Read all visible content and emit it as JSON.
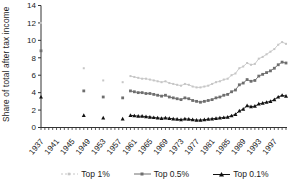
{
  "chart_data": {
    "type": "line",
    "title": "",
    "xlabel": "",
    "ylabel": "Share of total after tax income",
    "ylim": [
      0,
      14
    ],
    "yticks": [
      0,
      2,
      4,
      6,
      8,
      10,
      12,
      14
    ],
    "xlim": [
      1937,
      2000
    ],
    "xtick_labels": [
      "1937",
      "1941",
      "1945",
      "1949",
      "1953",
      "1957",
      "1961",
      "1965",
      "1969",
      "1973",
      "1977",
      "1981",
      "1985",
      "1989",
      "1993",
      "1997"
    ],
    "minor_tick_every_year": true,
    "grid": false,
    "legend_position": "bottom",
    "axis_color": "#333333",
    "series": [
      {
        "name": "Top 1%",
        "color": "#c6c6c6",
        "marker": "dot",
        "sparse_years": [
          1937,
          1948,
          1953,
          1958
        ],
        "sparse_values": [
          12.0,
          6.8,
          5.4,
          5.2
        ],
        "annual_start_year": 1960,
        "annual_values": [
          5.9,
          5.8,
          5.7,
          5.6,
          5.6,
          5.5,
          5.4,
          5.3,
          5.2,
          5.3,
          5.1,
          5.0,
          4.9,
          4.8,
          5.0,
          4.9,
          4.7,
          4.6,
          4.6,
          4.7,
          4.8,
          5.0,
          5.2,
          5.3,
          5.5,
          5.6,
          6.0,
          6.2,
          6.8,
          7.0,
          7.4,
          7.2,
          7.3,
          7.9,
          8.1,
          8.4,
          8.7,
          9.0,
          9.5,
          9.8,
          9.6
        ]
      },
      {
        "name": "Top 0.5%",
        "color": "#6e6e6e",
        "marker": "square",
        "sparse_years": [
          1937,
          1948,
          1953,
          1958
        ],
        "sparse_values": [
          8.8,
          4.2,
          3.5,
          3.4
        ],
        "annual_start_year": 1960,
        "annual_values": [
          4.2,
          4.1,
          4.0,
          4.0,
          3.9,
          3.9,
          3.8,
          3.7,
          3.6,
          3.7,
          3.5,
          3.4,
          3.3,
          3.2,
          3.4,
          3.3,
          3.1,
          3.0,
          2.9,
          3.0,
          3.1,
          3.2,
          3.4,
          3.5,
          3.7,
          3.8,
          4.1,
          4.3,
          4.9,
          5.1,
          5.5,
          5.3,
          5.4,
          5.9,
          6.1,
          6.3,
          6.5,
          6.8,
          7.2,
          7.5,
          7.4
        ]
      },
      {
        "name": "Top 0.1%",
        "color": "#111111",
        "marker": "triangle",
        "sparse_years": [
          1937,
          1948,
          1953,
          1958
        ],
        "sparse_values": [
          3.5,
          1.4,
          1.1,
          1.0
        ],
        "annual_start_year": 1960,
        "annual_values": [
          1.4,
          1.35,
          1.3,
          1.3,
          1.25,
          1.2,
          1.15,
          1.1,
          1.05,
          1.1,
          1.05,
          1.0,
          0.95,
          0.9,
          1.0,
          0.95,
          0.9,
          0.85,
          0.85,
          0.9,
          0.95,
          1.0,
          1.05,
          1.1,
          1.15,
          1.2,
          1.35,
          1.5,
          1.9,
          2.1,
          2.5,
          2.4,
          2.45,
          2.7,
          2.8,
          2.9,
          3.0,
          3.2,
          3.5,
          3.7,
          3.6
        ]
      }
    ]
  }
}
